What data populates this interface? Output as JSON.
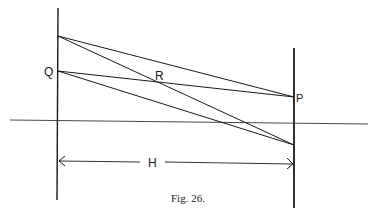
{
  "figure": {
    "caption": "Fig. 26.",
    "line_color": "#1a1a1a",
    "background": "#ffffff"
  },
  "labels": {
    "Q": "Q",
    "R": "R",
    "P": "P",
    "H": "H"
  },
  "geometry": {
    "left_vertical": {
      "x": 58,
      "y1": 8,
      "y2": 200
    },
    "right_vertical": {
      "x": 294,
      "y1": 48,
      "y2": 208
    },
    "axis": {
      "x1": 10,
      "y1": 120,
      "x2": 368,
      "y2": 124
    },
    "points": {
      "upper_left": [
        58,
        36
      ],
      "Q": [
        58,
        71
      ],
      "P": [
        294,
        97
      ],
      "lower_right": [
        294,
        145
      ],
      "R": [
        160,
        80
      ]
    },
    "rays": [
      {
        "from": "upper_left",
        "to": "P"
      },
      {
        "from": "upper_left",
        "to": "lower_right"
      },
      {
        "from": "Q",
        "to": "P"
      },
      {
        "from": "Q",
        "to": "lower_right"
      }
    ],
    "dimension_H": {
      "y": 162,
      "x1": 58,
      "x2": 294
    }
  }
}
